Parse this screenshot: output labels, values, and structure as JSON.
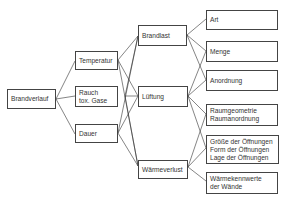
{
  "diagram": {
    "root": {
      "label": "Brandverlauf"
    },
    "level1": [
      {
        "lines": [
          "Temperatur"
        ]
      },
      {
        "lines": [
          "Rauch",
          "tox. Gase"
        ]
      },
      {
        "lines": [
          "Dauer"
        ]
      }
    ],
    "level2": [
      {
        "lines": [
          "Brandlast"
        ]
      },
      {
        "lines": [
          "Lüftung"
        ]
      },
      {
        "lines": [
          "Wärmeverlust"
        ]
      }
    ],
    "level3": [
      {
        "lines": [
          "Art"
        ]
      },
      {
        "lines": [
          "Menge"
        ]
      },
      {
        "lines": [
          "Anordnung"
        ]
      },
      {
        "lines": [
          "Raumgeometrie",
          "Raumanordnung"
        ]
      },
      {
        "lines": [
          "Größe der Öffnungen",
          "Form der Öffnungen",
          "Lage der Öffnungen"
        ]
      },
      {
        "lines": [
          "Wärmekennwerte",
          "der Wände"
        ]
      }
    ],
    "line_color": "#333333",
    "border_color": "#444444"
  }
}
